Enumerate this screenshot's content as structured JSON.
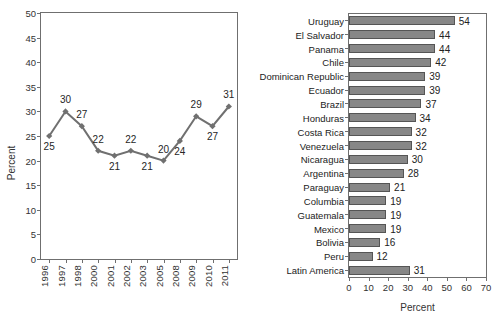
{
  "chart_data": [
    {
      "type": "line",
      "title": "",
      "xlabel": "",
      "ylabel": "Percent",
      "ylim": [
        0,
        50
      ],
      "yticks": [
        0,
        5,
        10,
        15,
        20,
        25,
        30,
        35,
        40,
        45,
        50
      ],
      "grid": false,
      "legend": "none",
      "marker": "diamond",
      "series_color": "#707070",
      "categories": [
        "1996",
        "1997",
        "1998",
        "2000",
        "2001",
        "2002",
        "2003",
        "2005",
        "2008",
        "2009",
        "2010",
        "2011"
      ],
      "values": [
        25,
        30,
        27,
        22,
        21,
        22,
        21,
        20,
        24,
        29,
        27,
        31
      ],
      "point_labels": [
        "25",
        "30",
        "27",
        "22",
        "21",
        "22",
        "21",
        "20",
        "24",
        "29",
        "27",
        "31"
      ],
      "point_label_positions": [
        "below",
        "above",
        "above",
        "above",
        "below",
        "above",
        "below",
        "above",
        "below",
        "above",
        "below",
        "above"
      ]
    },
    {
      "type": "bar",
      "orientation": "horizontal",
      "title": "",
      "xlabel": "Percent",
      "ylabel": "",
      "xlim": [
        0,
        70
      ],
      "xticks": [
        0,
        10,
        20,
        30,
        40,
        50,
        60,
        70
      ],
      "grid": false,
      "legend": "none",
      "bar_color": "#878787",
      "bar_edge_color": "#555555",
      "categories": [
        "Uruguay",
        "El Salvador",
        "Panama",
        "Chile",
        "Dominican Republic",
        "Ecuador",
        "Brazil",
        "Honduras",
        "Costa Rica",
        "Venezuela",
        "Nicaragua",
        "Argentina",
        "Paraguay",
        "Columbia",
        "Guatemala",
        "Mexico",
        "Bolivia",
        "Peru",
        "Latin America"
      ],
      "values": [
        54,
        44,
        44,
        42,
        39,
        39,
        37,
        34,
        32,
        32,
        30,
        28,
        21,
        19,
        19,
        19,
        16,
        12,
        31
      ],
      "value_labels": [
        "54",
        "44",
        "44",
        "42",
        "39",
        "39",
        "37",
        "34",
        "32",
        "32",
        "30",
        "28",
        "21",
        "19",
        "19",
        "19",
        "16",
        "12",
        "31"
      ]
    }
  ]
}
